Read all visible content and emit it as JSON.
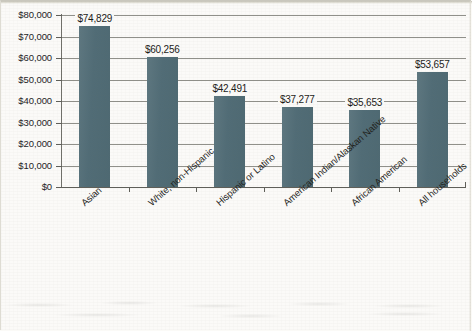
{
  "figure": {
    "background_color": "#fbfaf8",
    "bar_color": "#55707a",
    "gridline_color": "#8a8a84",
    "axis_color": "#5f5f59",
    "text_color": "#1f1f1c"
  },
  "chart_data": {
    "type": "bar",
    "title": "",
    "subtitle": "",
    "xlabel": "",
    "ylabel": "",
    "categories": [
      "Asian",
      "White, non-Hispanic",
      "Hispanic or Latino",
      "American Indian/Alaskan Native",
      "African American",
      "All households"
    ],
    "values": [
      74829,
      60256,
      42491,
      37277,
      35653,
      53657
    ],
    "value_labels": [
      "$74,829",
      "$60,256",
      "$42,491",
      "$37,277",
      "$35,653",
      "$53,657"
    ],
    "ylim": [
      0,
      80000
    ],
    "ytick_values": [
      0,
      10000,
      20000,
      30000,
      40000,
      50000,
      60000,
      70000,
      80000
    ],
    "ytick_labels": [
      "$0",
      "$10,000",
      "$20,000",
      "$30,000",
      "$40,000",
      "$50,000",
      "$60,000",
      "$70,000",
      "$80,000"
    ],
    "grid": true,
    "grid_axis": "y",
    "legend": false,
    "legend_position": "none",
    "xtick_label_rotation_deg": -41,
    "series": [
      {
        "name": "Median household income",
        "values": [
          74829,
          60256,
          42491,
          37277,
          35653,
          53657
        ]
      }
    ]
  }
}
